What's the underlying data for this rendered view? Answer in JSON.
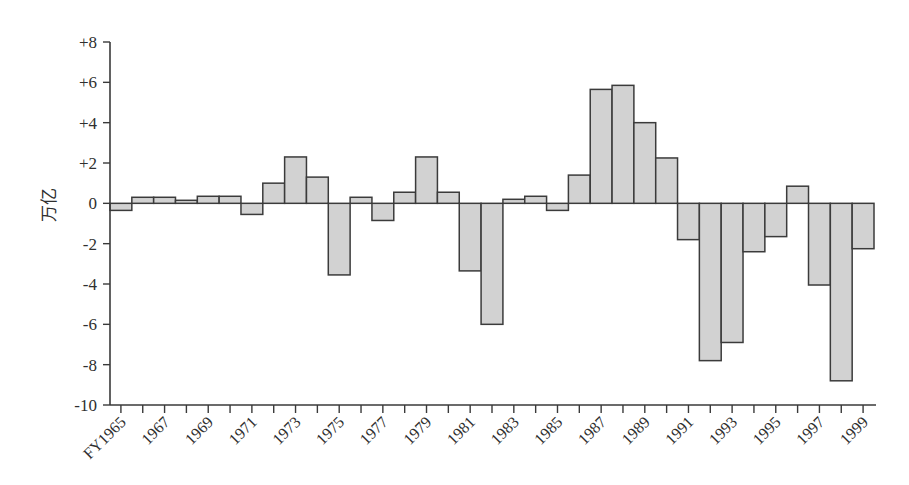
{
  "chart_data": {
    "type": "bar",
    "title": "",
    "xlabel": "",
    "ylabel": "万亿",
    "ylim": [
      -10,
      8
    ],
    "ytick_labels": [
      "+8",
      "+6",
      "+4",
      "+2",
      "0",
      "-2",
      "-4",
      "-6",
      "-8",
      "-10"
    ],
    "ytick_values": [
      8,
      6,
      4,
      2,
      0,
      -2,
      -4,
      -6,
      -8,
      -10
    ],
    "grid": false,
    "legend": null,
    "categories": [
      "FY1965",
      "1966",
      "1967",
      "1968",
      "1969",
      "1970",
      "1971",
      "1972",
      "1973",
      "1974",
      "1975",
      "1976",
      "1977",
      "1978",
      "1979",
      "1980",
      "1981",
      "1982",
      "1983",
      "1984",
      "1985",
      "1986",
      "1987",
      "1988",
      "1989",
      "1990",
      "1991",
      "1992",
      "1993",
      "1994",
      "1995",
      "1996",
      "1997",
      "1998",
      "1999"
    ],
    "xtick_labels_shown": [
      "FY1965",
      "1967",
      "1969",
      "1971",
      "1973",
      "1975",
      "1977",
      "1979",
      "1981",
      "1983",
      "1985",
      "1987",
      "1989",
      "1991",
      "1993",
      "1995",
      "1997",
      "1999"
    ],
    "values": [
      -0.35,
      0.3,
      0.3,
      0.15,
      0.35,
      0.35,
      -0.55,
      1.0,
      2.3,
      1.3,
      -3.55,
      0.3,
      -0.85,
      0.55,
      2.3,
      0.55,
      -3.35,
      -6.0,
      0.2,
      0.35,
      -0.35,
      1.4,
      5.65,
      5.85,
      4.0,
      2.25,
      -1.8,
      -7.8,
      -6.9,
      -2.4,
      -1.65,
      0.85,
      -4.05,
      -8.8,
      -2.25
    ],
    "bar_fill_color": "#d2d2d2",
    "bar_edge_color": "#3b3b3b",
    "axis_color": "#3a3a3a"
  }
}
